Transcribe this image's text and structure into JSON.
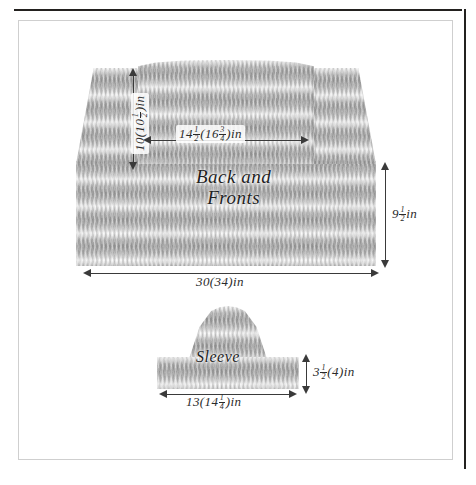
{
  "diagram": {
    "title": "Back and Fronts",
    "pieces": [
      {
        "id": "body",
        "name_line1": "Back and",
        "name_line2": "Fronts"
      },
      {
        "id": "sleeve",
        "name": "Sleeve"
      }
    ]
  },
  "measurements": {
    "body_armhole_depth": {
      "label": "10(10½)in",
      "whole": "10(10",
      "frac_num": "1",
      "frac_den": "2",
      "suffix": ")in",
      "orientation": "vertical"
    },
    "body_upper_width": {
      "label": "14½(16¾)in",
      "whole_a": "14",
      "frac_a_num": "1",
      "frac_a_den": "2",
      "mid": "(16",
      "frac_b_num": "3",
      "frac_b_den": "4",
      "suffix": ")in",
      "orientation": "horizontal"
    },
    "body_lower_depth": {
      "label": "9½in",
      "whole": "9",
      "frac_num": "1",
      "frac_den": "2",
      "suffix": "in",
      "orientation": "vertical"
    },
    "body_total_width": {
      "label": "30(34)in",
      "orientation": "horizontal"
    },
    "sleeve_depth": {
      "label": "3½(4)in",
      "whole": "3",
      "frac_num": "1",
      "frac_den": "2",
      "suffix": "(4)in",
      "orientation": "vertical"
    },
    "sleeve_width": {
      "label": "13(14¼)in",
      "whole": "13(14",
      "frac_num": "1",
      "frac_den": "4",
      "suffix": ")in",
      "orientation": "horizontal"
    }
  },
  "colors": {
    "ink": "#2b2b2b",
    "rule": "#23211f",
    "frame": "#cfcfcf",
    "fabric": "#b9b9b9",
    "paper": "#ffffff"
  }
}
